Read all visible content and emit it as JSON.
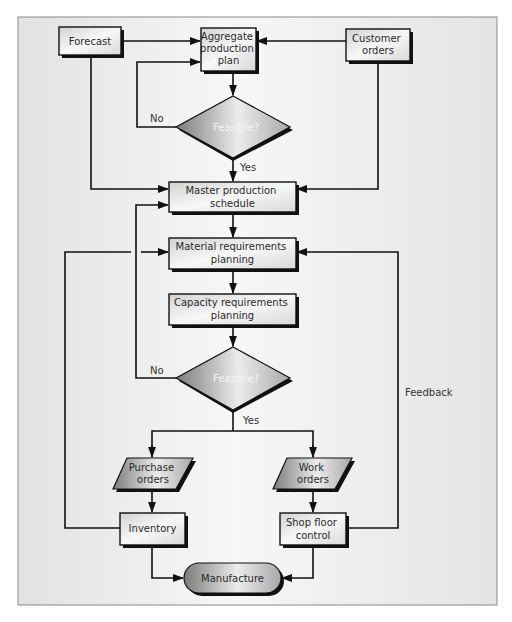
{
  "diagram": {
    "colors": {
      "frame_bg": "#e9e9e9",
      "frame_border": "#8a8a8a",
      "box_light": "#f6f6f6",
      "box_mid": "#d6d6d6",
      "shape_dark": "#8a8a8a",
      "line": "#111111",
      "shadow": "#111111"
    },
    "nodes": {
      "forecast": {
        "lines": [
          "Forecast"
        ]
      },
      "aggregate_plan": {
        "lines": [
          "Aggregate",
          "production",
          "plan"
        ]
      },
      "customer_orders": {
        "lines": [
          "Customer",
          "orders"
        ]
      },
      "feasible_1": {
        "lines": [
          "Feasible?"
        ]
      },
      "mps": {
        "lines": [
          "Master production",
          "schedule"
        ]
      },
      "mrp": {
        "lines": [
          "Material requirements",
          "planning"
        ]
      },
      "crp": {
        "lines": [
          "Capacity requirements",
          "planning"
        ]
      },
      "feasible_2": {
        "lines": [
          "Feasible?"
        ]
      },
      "purchase_orders": {
        "lines": [
          "Purchase",
          "orders"
        ]
      },
      "work_orders": {
        "lines": [
          "Work",
          "orders"
        ]
      },
      "inventory": {
        "lines": [
          "Inventory"
        ]
      },
      "shop_floor": {
        "lines": [
          "Shop floor",
          "control"
        ]
      },
      "manufacture": {
        "lines": [
          "Manufacture"
        ]
      }
    },
    "edge_labels": {
      "no_1": "No",
      "yes_1": "Yes",
      "no_2": "No",
      "yes_2": "Yes",
      "feedback": "Feedback"
    }
  }
}
